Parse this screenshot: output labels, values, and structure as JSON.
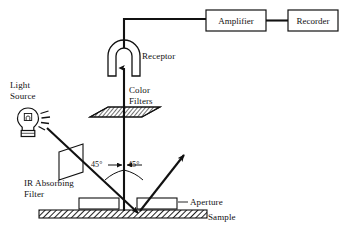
{
  "diagram": {
    "type": "optical-instrument-schematic",
    "colors": {
      "stroke": "#111111",
      "background": "#ffffff",
      "hatch": "#333333"
    },
    "labels": {
      "light_source": "Light\nSource",
      "ir_filter": "IR Absorbing\nFilter",
      "color_filters": "Color\nFilters",
      "receptor": "Receptor",
      "amplifier": "Amplifier",
      "recorder": "Recorder",
      "aperture": "Aperture",
      "sample": "Sample",
      "angle_left": "45°",
      "angle_right": "45°"
    },
    "components": [
      {
        "id": "light-source",
        "name": "Light Source",
        "shape": "light-bulb"
      },
      {
        "id": "ir-absorbing-filter",
        "name": "IR Absorbing Filter",
        "shape": "parallelogram-plate"
      },
      {
        "id": "sample",
        "name": "Sample",
        "shape": "hatched-slab"
      },
      {
        "id": "aperture-left",
        "name": "Aperture",
        "shape": "rectangle"
      },
      {
        "id": "aperture-right",
        "name": "Aperture",
        "shape": "rectangle"
      },
      {
        "id": "color-filters",
        "name": "Color Filters",
        "shape": "hatched-parallelogram-plate"
      },
      {
        "id": "receptor",
        "name": "Receptor",
        "shape": "horseshoe-arch"
      },
      {
        "id": "amplifier",
        "name": "Amplifier",
        "shape": "box"
      },
      {
        "id": "recorder",
        "name": "Recorder",
        "shape": "box"
      }
    ],
    "beams": [
      {
        "id": "incident-beam",
        "from": "light-source",
        "to": "sample",
        "angle_deg": 45
      },
      {
        "id": "specular-beam",
        "from": "sample",
        "to": "upper-right",
        "angle_deg": 45
      },
      {
        "id": "detected-beam",
        "from": "sample",
        "to": "receptor",
        "angle_deg": 0
      }
    ],
    "wires": [
      {
        "id": "receptor-to-amplifier",
        "from": "receptor",
        "to": "amplifier"
      },
      {
        "id": "amplifier-to-recorder",
        "from": "amplifier",
        "to": "recorder"
      }
    ]
  }
}
